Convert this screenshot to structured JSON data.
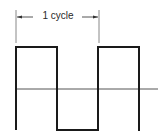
{
  "diagram": {
    "cycle_label": "1 cycle",
    "colors": {
      "waveform": "#1a1a1a",
      "axis": "#555555",
      "marker": "#888888",
      "text": "#2a2a2a",
      "background": "#ffffff"
    },
    "cycle_marker": {
      "left_x": 16,
      "right_x": 99,
      "y_top": 10,
      "y_bottom": 43,
      "arrow_y": 17
    },
    "axis": {
      "y": 89,
      "x_start": 16,
      "x_end": 158
    },
    "waveform": {
      "high_y": 47,
      "low_y": 130,
      "transitions_x": [
        16,
        57,
        98,
        139
      ],
      "points": [
        [
          16,
          130
        ],
        [
          16,
          47
        ],
        [
          57,
          47
        ],
        [
          57,
          130
        ],
        [
          98,
          130
        ],
        [
          98,
          47
        ],
        [
          139,
          47
        ],
        [
          139,
          131
        ]
      ]
    }
  }
}
